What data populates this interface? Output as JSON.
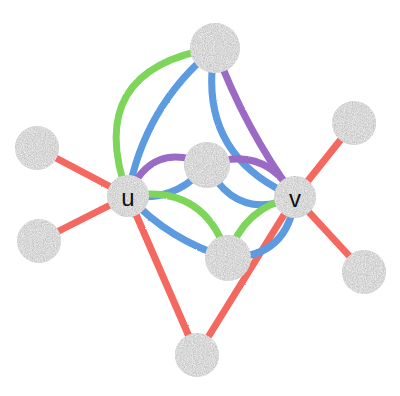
{
  "diagram": {
    "width": 400,
    "height": 396,
    "background": "#ffffff"
  },
  "palette": {
    "red": "#F4685E",
    "green": "#7DD65A",
    "blue": "#5B9BE0",
    "purple": "#9B6BC4",
    "node_fill": "#BFBFBF",
    "node_speckle_light": "#E2E2E2",
    "node_speckle_dark": "#9A9A9A",
    "label_color": "#111111"
  },
  "style": {
    "edge_width_straight": 7,
    "edge_width_curved": 7,
    "node_radius_labeled": 21,
    "node_radius_plain": 21,
    "label_font_size": 24
  },
  "nodes": [
    {
      "id": "u",
      "label": "u",
      "x": 128,
      "y": 196,
      "r": 21,
      "labeled": true
    },
    {
      "id": "v",
      "label": "v",
      "x": 295,
      "y": 197,
      "r": 21,
      "labeled": true
    },
    {
      "id": "t",
      "label": "",
      "x": 215,
      "y": 48,
      "r": 25,
      "labeled": false
    },
    {
      "id": "c",
      "label": "",
      "x": 207,
      "y": 165,
      "r": 23,
      "labeled": false
    },
    {
      "id": "m",
      "label": "",
      "x": 228,
      "y": 258,
      "r": 23,
      "labeled": false
    },
    {
      "id": "b",
      "label": "",
      "x": 197,
      "y": 355,
      "r": 22,
      "labeled": false
    },
    {
      "id": "lu",
      "label": "",
      "x": 37,
      "y": 148,
      "r": 22,
      "labeled": false
    },
    {
      "id": "ll",
      "label": "",
      "x": 39,
      "y": 241,
      "r": 22,
      "labeled": false
    },
    {
      "id": "ru",
      "label": "",
      "x": 354,
      "y": 123,
      "r": 22,
      "labeled": false
    },
    {
      "id": "rl",
      "label": "",
      "x": 364,
      "y": 272,
      "r": 22,
      "labeled": false
    }
  ],
  "edges": [
    {
      "id": "e-u-lu",
      "from": "u",
      "to": "lu",
      "color": "red",
      "curve": 0,
      "width": 7
    },
    {
      "id": "e-u-ll",
      "from": "u",
      "to": "ll",
      "color": "red",
      "curve": 0,
      "width": 7
    },
    {
      "id": "e-u-b",
      "from": "u",
      "to": "b",
      "color": "red",
      "curve": 0,
      "width": 7
    },
    {
      "id": "e-v-b",
      "from": "v",
      "to": "b",
      "color": "red",
      "curve": 0,
      "width": 7
    },
    {
      "id": "e-v-ru",
      "from": "v",
      "to": "ru",
      "color": "red",
      "curve": 0,
      "width": 7
    },
    {
      "id": "e-v-rl",
      "from": "v",
      "to": "rl",
      "color": "red",
      "curve": 0,
      "width": 7
    },
    {
      "id": "e-u-t-green",
      "from": "u",
      "to": "t",
      "color": "green",
      "curve": -52,
      "width": 7
    },
    {
      "id": "e-u-t-blue",
      "from": "u",
      "to": "t",
      "color": "blue",
      "curve": -16,
      "width": 7
    },
    {
      "id": "e-v-t-blue",
      "from": "v",
      "to": "t",
      "color": "blue",
      "curve": -34,
      "width": 7
    },
    {
      "id": "e-v-t-purple",
      "from": "v",
      "to": "t",
      "color": "purple",
      "curve": -6,
      "width": 7
    },
    {
      "id": "e-u-c-purple",
      "from": "u",
      "to": "c",
      "color": "purple",
      "curve": -22,
      "width": 7
    },
    {
      "id": "e-u-c-blue",
      "from": "u",
      "to": "c",
      "color": "blue",
      "curve": 12,
      "width": 7
    },
    {
      "id": "e-v-c-purple",
      "from": "c",
      "to": "v",
      "color": "purple",
      "curve": -20,
      "width": 7
    },
    {
      "id": "e-v-c-blue",
      "from": "c",
      "to": "v",
      "color": "blue",
      "curve": 22,
      "width": 7
    },
    {
      "id": "e-u-m-green",
      "from": "u",
      "to": "m",
      "color": "green",
      "curve": -26,
      "width": 7
    },
    {
      "id": "e-u-m-blue",
      "from": "u",
      "to": "m",
      "color": "blue",
      "curve": 8,
      "width": 7
    },
    {
      "id": "e-v-m-green",
      "from": "m",
      "to": "v",
      "color": "green",
      "curve": -14,
      "width": 7
    },
    {
      "id": "e-v-m-blue",
      "from": "m",
      "to": "v",
      "color": "blue",
      "curve": 20,
      "width": 7
    }
  ],
  "labels": {
    "u": "u",
    "v": "v"
  }
}
